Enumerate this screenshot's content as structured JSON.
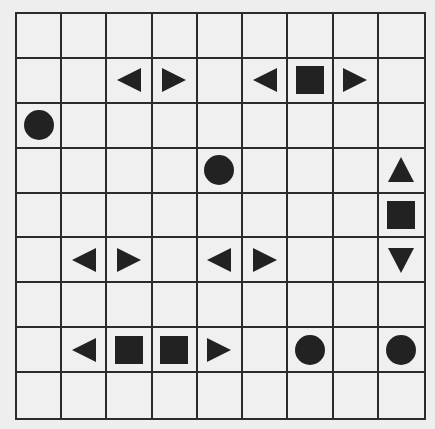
{
  "puzzle": {
    "type": "battleship",
    "rows": 9,
    "cols": 9,
    "colors": {
      "background": "#eeeeee",
      "cell": "#f0f0f0",
      "grid_line": "#2b2b2b",
      "piece": "#222222"
    },
    "pieces": [
      {
        "row": 1,
        "col": 2,
        "shape": "end-left"
      },
      {
        "row": 1,
        "col": 3,
        "shape": "end-right"
      },
      {
        "row": 1,
        "col": 5,
        "shape": "end-left"
      },
      {
        "row": 1,
        "col": 6,
        "shape": "middle"
      },
      {
        "row": 1,
        "col": 7,
        "shape": "end-right"
      },
      {
        "row": 2,
        "col": 0,
        "shape": "submarine"
      },
      {
        "row": 3,
        "col": 4,
        "shape": "submarine"
      },
      {
        "row": 3,
        "col": 8,
        "shape": "end-top"
      },
      {
        "row": 4,
        "col": 8,
        "shape": "middle"
      },
      {
        "row": 5,
        "col": 1,
        "shape": "end-left"
      },
      {
        "row": 5,
        "col": 2,
        "shape": "end-right"
      },
      {
        "row": 5,
        "col": 4,
        "shape": "end-left"
      },
      {
        "row": 5,
        "col": 5,
        "shape": "end-right"
      },
      {
        "row": 5,
        "col": 8,
        "shape": "end-bottom"
      },
      {
        "row": 7,
        "col": 1,
        "shape": "end-left"
      },
      {
        "row": 7,
        "col": 2,
        "shape": "middle"
      },
      {
        "row": 7,
        "col": 3,
        "shape": "middle"
      },
      {
        "row": 7,
        "col": 4,
        "shape": "end-right"
      },
      {
        "row": 7,
        "col": 6,
        "shape": "submarine"
      },
      {
        "row": 7,
        "col": 8,
        "shape": "submarine"
      }
    ]
  }
}
